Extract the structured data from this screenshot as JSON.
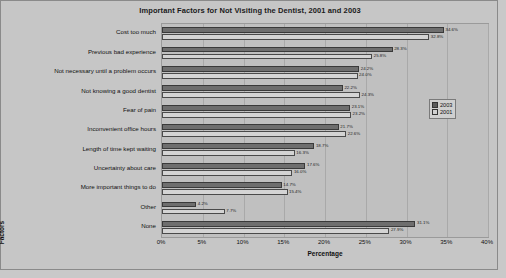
{
  "chart_data": {
    "type": "bar",
    "orientation": "horizontal",
    "title": "Important Factors for Not Visiting the Dentist, 2001 and 2003",
    "xlabel": "Percentage",
    "ylabel": "Factors",
    "xlim": [
      0,
      40
    ],
    "xticks": [
      "0%",
      "5%",
      "10%",
      "15%",
      "20%",
      "25%",
      "30%",
      "35%",
      "40%"
    ],
    "xtick_values": [
      0,
      5,
      10,
      15,
      20,
      25,
      30,
      35,
      40
    ],
    "grid": true,
    "legend_position": "right",
    "categories": [
      "Cost too much",
      "Previous bad experience",
      "Not necessary until a problem occurs",
      "Not knowing a good dentist",
      "Fear of pain",
      "Inconvenient office hours",
      "Length of time kept waiting",
      "Uncertainty about care",
      "More important things to do",
      "Other",
      "None"
    ],
    "series": [
      {
        "name": "2003",
        "color": "#6e6e6e",
        "values": [
          34.6,
          28.3,
          24.2,
          22.2,
          23.1,
          21.7,
          18.7,
          17.6,
          14.7,
          4.2,
          31.1
        ],
        "labels": [
          "34.6%",
          "28.3%",
          "24.2%",
          "22.2%",
          "23.1%",
          "21.7%",
          "18.7%",
          "17.6%",
          "14.7%",
          "4.2%",
          "31.1%"
        ]
      },
      {
        "name": "2001",
        "color": "#d4d4d4",
        "values": [
          32.8,
          25.8,
          24.0,
          24.3,
          23.2,
          22.6,
          16.3,
          16.0,
          15.4,
          7.7,
          27.9
        ],
        "labels": [
          "32.8%",
          "25.8%",
          "24.0%",
          "24.3%",
          "23.2%",
          "22.6%",
          "16.3%",
          "16.0%",
          "15.4%",
          "7.7%",
          "27.9%"
        ]
      }
    ]
  },
  "legend": {
    "entries": [
      {
        "label": "2003"
      },
      {
        "label": "2001"
      }
    ]
  }
}
